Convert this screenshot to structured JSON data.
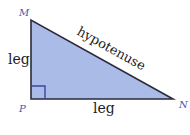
{
  "diagram": {
    "type": "right-triangle",
    "vertices": {
      "M": {
        "label": "M"
      },
      "P": {
        "label": "P"
      },
      "N": {
        "label": "N"
      }
    },
    "sides": {
      "vertical_leg": {
        "label": "leg"
      },
      "horizontal_leg": {
        "label": "leg"
      },
      "hypotenuse": {
        "label": "hypotenuse"
      }
    },
    "right_angle_at": "P",
    "colors": {
      "fill": "#a9bbe6",
      "stroke": "#2a2a3a",
      "right_angle_marker": "#3a48a0",
      "vertex_label": "#4a58a8"
    }
  }
}
